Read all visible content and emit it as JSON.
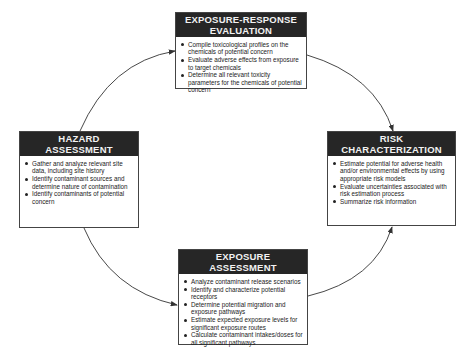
{
  "boxes": {
    "exposure_response": {
      "title_line1": "EXPOSURE-RESPONSE",
      "title_line2": "EVALUATION",
      "items": [
        "Compile toxicological profiles on the chemicals of potential concern",
        "Evaluate adverse effects from exposure to target chemicals",
        "Determine all relevant toxicity parameters for the chemicals of potential concern"
      ]
    },
    "hazard": {
      "title_line1": "HAZARD",
      "title_line2": "ASSESSMENT",
      "items": [
        "Gather and analyze relevant site data, including site history",
        "Identify contaminant sources and determine nature of contamination",
        "Identify contaminants of potential concern"
      ]
    },
    "risk": {
      "title_line1": "RISK",
      "title_line2": "CHARACTERIZATION",
      "items": [
        "Estimate potential for adverse health and/or environmental effects by using appropriate risk models",
        "Evaluate uncertainties associated with risk estimation process",
        "Summarize risk information"
      ]
    },
    "exposure": {
      "title_line1": "EXPOSURE",
      "title_line2": "ASSESSMENT",
      "items": [
        "Analyze contaminant release scenarios",
        "Identify and characterize potential receptors",
        "Determine potential migration and exposure pathways",
        "Estimate expected exposure levels for significant exposure routes",
        "Calculate contaminant intakes/doses for all significant pathways"
      ]
    }
  },
  "flow": [
    {
      "from": "hazard",
      "to": "exposure_response"
    },
    {
      "from": "exposure_response",
      "to": "risk"
    },
    {
      "from": "hazard",
      "to": "exposure"
    },
    {
      "from": "exposure",
      "to": "risk"
    }
  ]
}
